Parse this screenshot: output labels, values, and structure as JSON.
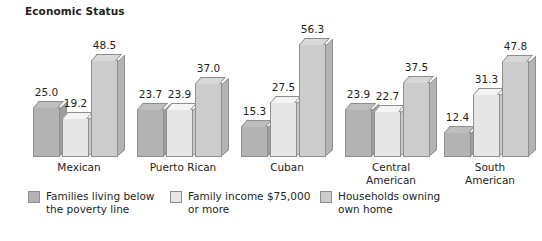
{
  "chart_data": {
    "type": "bar",
    "title": "Economic Status",
    "subtitle": "",
    "xlabel": "",
    "ylabel": "",
    "ylim": [
      0,
      60
    ],
    "grid": false,
    "legend_position": "bottom",
    "categories": [
      "Mexican",
      "Puerto Rican",
      "Cuban",
      "Central\nAmerican",
      "South\nAmerican"
    ],
    "series": [
      {
        "name": "Families living below\nthe poverty line",
        "color": "#b3b3b3",
        "values": [
          25.0,
          23.7,
          15.3,
          23.9,
          12.4
        ],
        "labels": [
          "25.0",
          "23.7",
          "15.3",
          "23.9",
          "12.4"
        ]
      },
      {
        "name": "Family income $75,000\nor more",
        "color": "#e6e6e6",
        "values": [
          19.2,
          23.9,
          27.5,
          22.7,
          31.3
        ],
        "labels": [
          "19.2",
          "23.9",
          "27.5",
          "22.7",
          "31.3"
        ]
      },
      {
        "name": "Households owning\nown home",
        "color": "#cccccc",
        "values": [
          48.5,
          37.0,
          56.3,
          37.5,
          47.8
        ],
        "labels": [
          "48.5",
          "37.0",
          "56.3",
          "37.5",
          "47.8"
        ]
      }
    ]
  },
  "title": "Economic Status",
  "legend": {
    "items": [
      {
        "label": "Families living below\nthe poverty line",
        "swatch_color": "#b3b3b3"
      },
      {
        "label": "Family income $75,000\nor more",
        "swatch_color": "#e6e6e6"
      },
      {
        "label": "Households owning\nown home",
        "swatch_color": "#cccccc"
      }
    ]
  },
  "groups": [
    {
      "label": "Mexican",
      "left": 33,
      "width": 92
    },
    {
      "label": "Puerto Rican",
      "left": 137,
      "width": 92
    },
    {
      "label": "Cuban",
      "left": 241,
      "width": 92
    },
    {
      "label": "Central\nAmerican",
      "left": 345,
      "width": 92
    },
    {
      "label": "South\nAmerican",
      "left": 444,
      "width": 92
    }
  ],
  "icons": {
    "legend_swatch": "square-swatch-icon"
  }
}
